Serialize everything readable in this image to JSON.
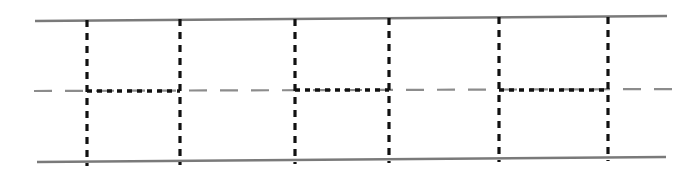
{
  "figure": {
    "width": 697,
    "height": 176,
    "background_color": "#ffffff"
  },
  "colors": {
    "rail": "#7a7a7a",
    "centerline": "#8c8c8c",
    "vertical_dashed": "#111111",
    "connector_dotted": "#111111"
  },
  "chart_data": {
    "type": "line",
    "xlabel": "",
    "ylabel": "",
    "xlim": [
      0,
      697
    ],
    "ylim": [
      176,
      0
    ],
    "grid": false,
    "legend": null,
    "series": [
      {
        "name": "top-rail",
        "style": "solid",
        "color": "#7a7a7a",
        "width": 2.4,
        "points": [
          [
            35,
            21
          ],
          [
            667,
            16
          ]
        ]
      },
      {
        "name": "bottom-rail",
        "style": "solid",
        "color": "#7a7a7a",
        "width": 2.4,
        "points": [
          [
            37,
            162
          ],
          [
            666,
            157
          ]
        ]
      },
      {
        "name": "centerline",
        "style": "long-dash",
        "color": "#8c8c8c",
        "width": 2.2,
        "dash": [
          18,
          13
        ],
        "points": [
          [
            34,
            91
          ],
          [
            682,
            89
          ]
        ]
      },
      {
        "name": "vertical-dashed-1",
        "style": "dashed",
        "color": "#111111",
        "width": 3.2,
        "dash": [
          7,
          6
        ],
        "points": [
          [
            87,
            20
          ],
          [
            87,
            166
          ]
        ]
      },
      {
        "name": "vertical-dashed-2",
        "style": "dashed",
        "color": "#111111",
        "width": 3.2,
        "dash": [
          7,
          6
        ],
        "points": [
          [
            180,
            19
          ],
          [
            180,
            165
          ]
        ]
      },
      {
        "name": "vertical-dashed-3",
        "style": "dashed",
        "color": "#111111",
        "width": 3.2,
        "dash": [
          7,
          6
        ],
        "points": [
          [
            295,
            19
          ],
          [
            295,
            164
          ]
        ]
      },
      {
        "name": "vertical-dashed-4",
        "style": "dashed",
        "color": "#111111",
        "width": 3.2,
        "dash": [
          7,
          6
        ],
        "points": [
          [
            389,
            18
          ],
          [
            389,
            163
          ]
        ]
      },
      {
        "name": "vertical-dashed-5",
        "style": "dashed",
        "color": "#111111",
        "width": 3.2,
        "dash": [
          7,
          6
        ],
        "points": [
          [
            499,
            17
          ],
          [
            499,
            162
          ]
        ]
      },
      {
        "name": "vertical-dashed-6",
        "style": "dashed",
        "color": "#111111",
        "width": 3.2,
        "dash": [
          7,
          6
        ],
        "points": [
          [
            608,
            17
          ],
          [
            608,
            161
          ]
        ]
      },
      {
        "name": "connector-dotted-1",
        "style": "dotted",
        "color": "#111111",
        "width": 3.4,
        "dash": [
          5,
          5
        ],
        "points": [
          [
            87,
            91
          ],
          [
            180,
            91
          ]
        ]
      },
      {
        "name": "connector-dotted-2",
        "style": "dotted",
        "color": "#111111",
        "width": 3.4,
        "dash": [
          5,
          5
        ],
        "points": [
          [
            295,
            90
          ],
          [
            389,
            90
          ]
        ]
      },
      {
        "name": "connector-dotted-3",
        "style": "dotted",
        "color": "#111111",
        "width": 3.4,
        "dash": [
          5,
          5
        ],
        "points": [
          [
            499,
            90
          ],
          [
            608,
            90
          ]
        ]
      }
    ],
    "annotations": []
  }
}
